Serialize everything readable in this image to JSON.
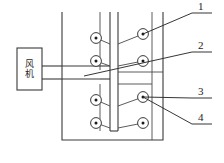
{
  "diagram": {
    "background_color": "#ffffff",
    "line_color": "#3a3a3a",
    "fan": {
      "label_char_1": "风",
      "label_char_2": "机",
      "label_full": "风机"
    },
    "callouts": [
      {
        "number": "1"
      },
      {
        "number": "2"
      },
      {
        "number": "3"
      },
      {
        "number": "4"
      }
    ],
    "probes": [
      {
        "id": "probe-top-left"
      },
      {
        "id": "probe-top-right"
      },
      {
        "id": "probe-upper-left"
      },
      {
        "id": "probe-upper-right"
      },
      {
        "id": "probe-lower-left"
      },
      {
        "id": "probe-lower-right"
      },
      {
        "id": "probe-bottom-left"
      },
      {
        "id": "probe-bottom-right"
      }
    ]
  }
}
